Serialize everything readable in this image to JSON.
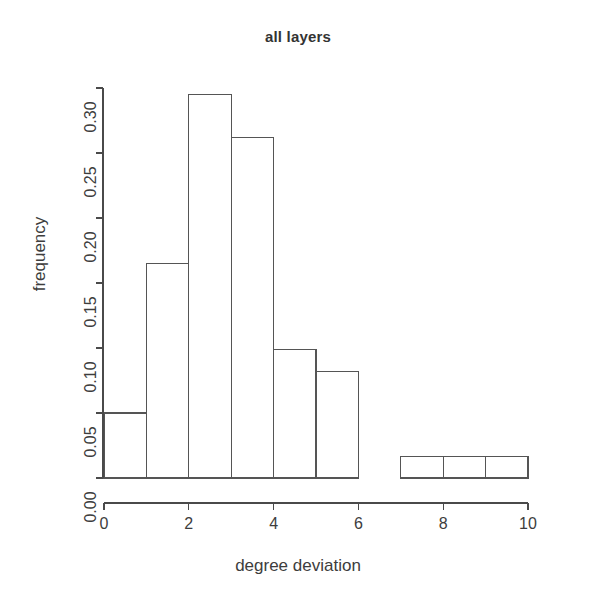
{
  "chart_data": {
    "type": "bar",
    "title": "all layers",
    "xlabel": "degree deviation",
    "ylabel": "frequency",
    "grid": false,
    "legend": "none",
    "bin_edges": [
      0,
      1,
      2,
      3,
      4,
      5,
      6,
      7,
      8,
      9,
      10
    ],
    "categories": [
      "0-1",
      "1-2",
      "2-3",
      "3-4",
      "4-5",
      "5-6",
      "6-7",
      "7-8",
      "8-9",
      "9-10"
    ],
    "values": [
      0.05,
      0.165,
      0.295,
      0.262,
      0.099,
      0.082,
      0.0,
      0.0165,
      0.0165,
      0.0165
    ],
    "xlim": [
      0,
      10
    ],
    "ylim": [
      0,
      0.3
    ],
    "xticks": [
      0,
      2,
      4,
      6,
      8,
      10
    ],
    "xtick_labels": [
      "0",
      "2",
      "4",
      "6",
      "8",
      "10"
    ],
    "yticks": [
      0.0,
      0.05,
      0.1,
      0.15,
      0.2,
      0.25,
      0.3
    ],
    "ytick_labels": [
      "0.00",
      "0.05",
      "0.10",
      "0.15",
      "0.20",
      "0.25",
      "0.30"
    ],
    "bar_fill": "#ffffff",
    "bar_stroke": "#555555",
    "axis_color": "#4a4a4a",
    "background": "#ffffff"
  }
}
